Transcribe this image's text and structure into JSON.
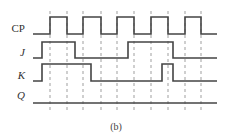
{
  "figure": {
    "caption": "(b)",
    "signals": [
      {
        "name": "CP",
        "italic": false,
        "label_y": 32,
        "low": 34,
        "high": 17,
        "points": [
          [
            33,
            "L"
          ],
          [
            50,
            "H"
          ],
          [
            67,
            "L"
          ],
          [
            83,
            "H"
          ],
          [
            101,
            "L"
          ],
          [
            117,
            "H"
          ],
          [
            134,
            "L"
          ],
          [
            151,
            "H"
          ],
          [
            168,
            "L"
          ],
          [
            185,
            "H"
          ],
          [
            201,
            "L"
          ],
          [
            217,
            "L"
          ]
        ]
      },
      {
        "name": "J",
        "italic": true,
        "label_y": 56,
        "low": 58,
        "high": 42,
        "points": [
          [
            33,
            "L"
          ],
          [
            42,
            "H"
          ],
          [
            75,
            "L"
          ],
          [
            128,
            "H"
          ],
          [
            173,
            "L"
          ],
          [
            217,
            "L"
          ]
        ]
      },
      {
        "name": "K",
        "italic": true,
        "label_y": 79,
        "low": 81,
        "high": 64,
        "points": [
          [
            33,
            "L"
          ],
          [
            42,
            "H"
          ],
          [
            91,
            "L"
          ],
          [
            162,
            "H"
          ],
          [
            173,
            "L"
          ],
          [
            217,
            "L"
          ]
        ]
      },
      {
        "name": "Q",
        "italic": true,
        "label_y": 99,
        "low": 103,
        "high": 103,
        "points": [
          [
            33,
            "L"
          ],
          [
            217,
            "L"
          ]
        ]
      }
    ],
    "dashed_lines_x": [
      50,
      67,
      83,
      101,
      117,
      134,
      151,
      168,
      185,
      201
    ],
    "dashed_y_range": [
      11,
      110
    ]
  }
}
